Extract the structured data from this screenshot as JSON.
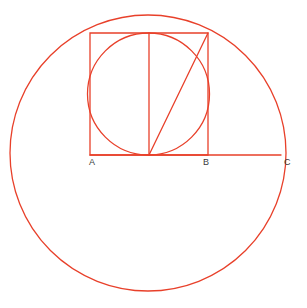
{
  "figure": {
    "canvas": {
      "width": 307,
      "height": 308,
      "background": "#ffffff"
    },
    "style": {
      "stroke_color": "#e8402a",
      "stroke_width": 1.3,
      "label_color": "#3a3a3a",
      "label_font_size": 9,
      "fill": "none"
    }
  },
  "chart_data": {
    "type": "diagram",
    "coordinate_space": {
      "x_range": [
        0,
        307
      ],
      "y_range": [
        0,
        308
      ],
      "y_axis": "down"
    },
    "shapes": [
      {
        "name": "outer-circle",
        "kind": "circle",
        "cx": 148,
        "cy": 153,
        "r": 138,
        "stroke": "#e8402a",
        "fill": "none",
        "note": "Large circle centered on baseline; passes through C at its rightmost point and through the top corners of the square."
      },
      {
        "name": "inner-circle",
        "kind": "circle",
        "cx": 148.5,
        "cy": 94,
        "r": 61,
        "stroke": "#e8402a",
        "fill": "none",
        "note": "Incircle inscribed in the square ABsquare; tangent to all four sides."
      },
      {
        "name": "square",
        "kind": "rect",
        "x": 90,
        "y": 33,
        "width": 118,
        "height": 122,
        "stroke": "#e8402a",
        "fill": "none",
        "note": "Square with base AB on the horizontal baseline."
      },
      {
        "name": "vertical-midline",
        "kind": "line",
        "x1": 149,
        "y1": 33,
        "x2": 149,
        "y2": 155,
        "stroke": "#e8402a",
        "note": "Vertical line through the centre of the square from top side to base."
      },
      {
        "name": "diagonal-line",
        "kind": "line",
        "x1": 149,
        "y1": 155,
        "x2": 208,
        "y2": 33,
        "stroke": "#e8402a",
        "note": "Diagonal from the foot of the midline to the top-right corner of the square."
      },
      {
        "name": "baseline",
        "kind": "line",
        "x1": 90,
        "y1": 155,
        "x2": 281,
        "y2": 155,
        "stroke": "#e8402a",
        "note": "Horizontal baseline from A through B to C."
      }
    ],
    "points": [
      {
        "name": "point-a",
        "label": "A",
        "x": 90,
        "y": 155,
        "label_x": 89,
        "label_y": 165,
        "note": "Bottom-left corner of the square."
      },
      {
        "name": "point-b",
        "label": "B",
        "x": 208,
        "y": 155,
        "label_x": 203,
        "label_y": 165,
        "note": "Bottom-right corner of the square."
      },
      {
        "name": "point-c",
        "label": "C",
        "x": 281,
        "y": 155,
        "label_x": 284,
        "label_y": 165,
        "note": "Rightmost point of the outer circle on the baseline."
      }
    ],
    "labels": [
      "A",
      "B",
      "C"
    ]
  }
}
